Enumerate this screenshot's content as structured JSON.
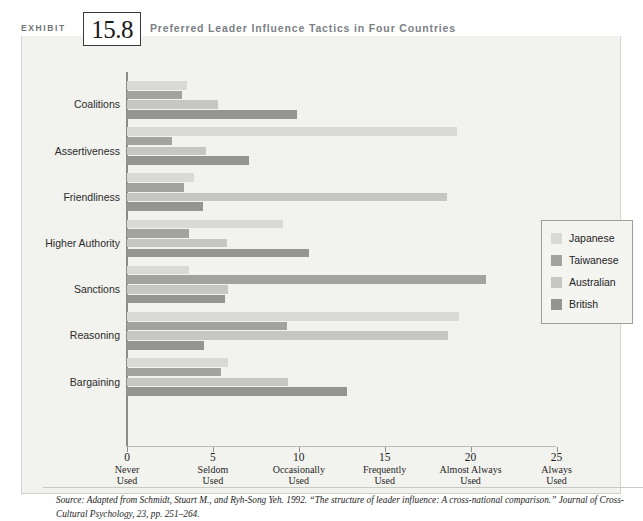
{
  "header": {
    "exhibit_word": "EXHIBIT",
    "exhibit_number": "15.8",
    "title": "Preferred Leader Influence Tactics in Four Countries"
  },
  "legend": {
    "items": [
      {
        "label": "Japanese",
        "color": "#d9d9d6",
        "key": "japanese"
      },
      {
        "label": "Taiwanese",
        "color": "#a2a29e",
        "key": "taiwanese"
      },
      {
        "label": "Australian",
        "color": "#c6c6c2",
        "key": "australian"
      },
      {
        "label": "British",
        "color": "#949490",
        "key": "british"
      }
    ]
  },
  "axis": {
    "ticks": [
      {
        "value": "0",
        "line1": "Never",
        "line2": "Used"
      },
      {
        "value": "5",
        "line1": "Seldom",
        "line2": "Used"
      },
      {
        "value": "10",
        "line1": "Occasionally",
        "line2": "Used"
      },
      {
        "value": "15",
        "line1": "Frequently",
        "line2": "Used"
      },
      {
        "value": "20",
        "line1": "Almost Always",
        "line2": "Used"
      },
      {
        "value": "25",
        "line1": "Always",
        "line2": "Used"
      }
    ]
  },
  "source": {
    "text": "Source: Adapted from Schmidt, Stuart M., and Ryh-Song Yeh. 1992. “The structure of leader influence: A cross-national comparison.” Journal of Cross-Cultural Psychology, 23, pp. 251–264."
  },
  "chart_data": {
    "type": "bar",
    "orientation": "horizontal",
    "title": "Preferred Leader Influence Tactics in Four Countries",
    "xlabel": "",
    "ylabel": "",
    "xlim": [
      0,
      25
    ],
    "grid": false,
    "legend_position": "right",
    "categories": [
      "Coalitions",
      "Assertiveness",
      "Friendliness",
      "Higher Authority",
      "Sanctions",
      "Reasoning",
      "Bargaining"
    ],
    "series": [
      {
        "name": "Japanese",
        "color": "#d9d9d6",
        "values": [
          3.5,
          19.2,
          3.9,
          9.1,
          3.6,
          19.3,
          5.9
        ]
      },
      {
        "name": "Taiwanese",
        "color": "#a2a29e",
        "values": [
          3.2,
          2.6,
          3.3,
          3.6,
          20.9,
          9.3,
          5.5
        ]
      },
      {
        "name": "Australian",
        "color": "#c6c6c2",
        "values": [
          5.3,
          4.6,
          18.6,
          5.8,
          5.9,
          18.7,
          9.4
        ]
      },
      {
        "name": "British",
        "color": "#949490",
        "values": [
          9.9,
          7.1,
          4.4,
          10.6,
          5.7,
          4.5,
          12.8
        ]
      }
    ],
    "xtick_values": [
      0,
      5,
      10,
      15,
      20,
      25
    ],
    "xtick_labels": [
      "Never Used",
      "Seldom Used",
      "Occasionally Used",
      "Frequently Used",
      "Almost Always Used",
      "Always Used"
    ]
  }
}
